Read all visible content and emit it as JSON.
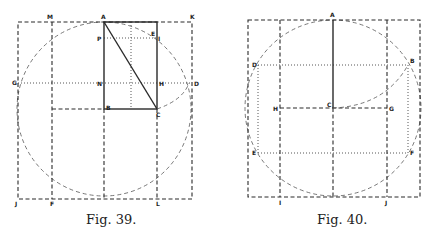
{
  "figures": [
    {
      "caption": "Fig. 39.",
      "labels": {
        "A": "A",
        "M": "M",
        "K": "K",
        "P": "P",
        "E": "E",
        "I": "I",
        "G": "G",
        "N": "N",
        "H": "H",
        "D": "D",
        "B": "B",
        "C": "C",
        "J": "J",
        "F": "F",
        "L": "L"
      }
    },
    {
      "caption": "Fig. 40.",
      "labels": {
        "A": "A",
        "D": "D",
        "B": "B",
        "H": "H",
        "C": "C",
        "G": "G",
        "E": "E",
        "F": "F",
        "I": "I",
        "J": "J"
      }
    }
  ]
}
